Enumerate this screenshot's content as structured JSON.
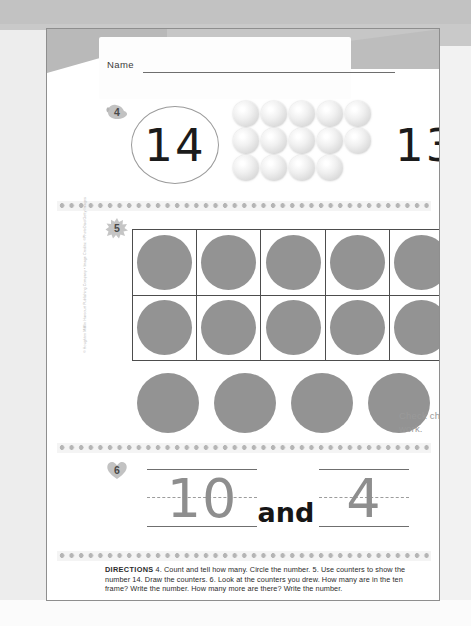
{
  "page": {
    "name_label": "Name",
    "footer_chapter": "Chapter 13 • Lesson 3",
    "footer_page_number": "497",
    "credit": "© Houghton Mifflin Harcourt Publishing Company • Image Credits: ©PhotoDisc/Getty Images"
  },
  "exercise4": {
    "marker_label": "4",
    "marker_icon": "bird-icon",
    "circled_number": "14",
    "plain_number": "13",
    "apple_rows": [
      5,
      5,
      4
    ],
    "apple_total": 14
  },
  "exercise5": {
    "marker_label": "5",
    "marker_icon": "starburst-icon",
    "ten_frame_rows": 2,
    "ten_frame_cols": 5,
    "ten_frame_filled": 10,
    "drawn_counters": 4,
    "annotation": "Check children's work."
  },
  "exercise6": {
    "marker_label": "6",
    "marker_icon": "heart-icon",
    "first_number": "10",
    "conjunction": "and",
    "second_number": "4"
  },
  "directions": {
    "heading": "DIRECTIONS",
    "text": "4. Count and tell how many. Circle the number.   5. Use counters to show the number 14. Draw the counters.   6. Look at the counters you drew. How many are in the ten frame? Write the number. How many more are there? Write the number."
  },
  "colors": {
    "counter_gray": "#939393",
    "write_number_gray": "#8e8e8e",
    "annotation_gray": "#9a9a9a",
    "rule_dark": "#4d4d4d"
  }
}
